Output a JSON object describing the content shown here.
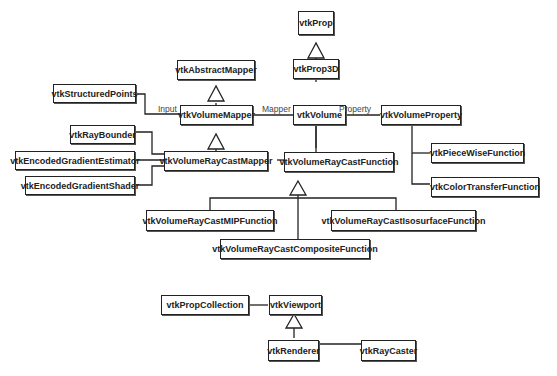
{
  "diagram": {
    "type": "uml-class-diagram",
    "classes": {
      "vtkProp": "vtkProp",
      "vtkProp3D": "vtkProp3D",
      "vtkAbstractMapper": "vtkAbstractMapper",
      "vtkStructuredPoints": "vtkStructuredPoints",
      "vtkVolumeMapper": "vtkVolumeMapper",
      "vtkVolume": "vtkVolume",
      "vtkVolumeProperty": "vtkVolumeProperty",
      "vtkRayBounder": "vtkRayBounder",
      "vtkEncodedGradientEstimator": "vtkEncodedGradientEstimator",
      "vtkEncodedGradientShader": "vtkEncodedGradientShader",
      "vtkVolumeRayCastMapper": "vtkVolumeRayCastMapper",
      "vtkVolumeRayCastFunction": "vtkVolumeRayCastFunction",
      "vtkPieceWiseFunction": "vtkPieceWiseFunction",
      "vtkColorTransferFunction": "vtkColorTransferFunction",
      "vtkVolumeRayCastMIPFunction": "vtkVolumeRayCastMIPFunction",
      "vtkVolumeRayCastIsosurfaceFunction": "vtkVolumeRayCastIsosurfaceFunction",
      "vtkVolumeRayCastCompositeFunction": "vtkVolumeRayCastCompositeFunction",
      "vtkPropCollection": "vtkPropCollection",
      "vtkViewport": "vtkViewport",
      "vtkRenderer": "vtkRenderer",
      "vtkRayCaster": "vtkRayCaster"
    },
    "association_labels": {
      "input": "Input",
      "mapper": "Mapper",
      "property": "Property"
    },
    "relations": [
      {
        "type": "inheritance",
        "child": "vtkProp3D",
        "parent": "vtkProp"
      },
      {
        "type": "inheritance",
        "child": "vtkVolume",
        "parent": "vtkProp3D"
      },
      {
        "type": "inheritance",
        "child": "vtkVolumeMapper",
        "parent": "vtkAbstractMapper"
      },
      {
        "type": "inheritance",
        "child": "vtkVolumeRayCastMapper",
        "parent": "vtkVolumeMapper"
      },
      {
        "type": "inheritance",
        "child": "vtkVolumeRayCastMIPFunction",
        "parent": "vtkVolumeRayCastFunction"
      },
      {
        "type": "inheritance",
        "child": "vtkVolumeRayCastIsosurfaceFunction",
        "parent": "vtkVolumeRayCastFunction"
      },
      {
        "type": "inheritance",
        "child": "vtkVolumeRayCastCompositeFunction",
        "parent": "vtkVolumeRayCastFunction"
      },
      {
        "type": "inheritance",
        "child": "vtkRenderer",
        "parent": "vtkViewport"
      },
      {
        "type": "association",
        "from": "vtkStructuredPoints",
        "to": "vtkVolumeMapper",
        "label": "Input"
      },
      {
        "type": "association",
        "from": "vtkVolumeMapper",
        "to": "vtkVolume",
        "label": "Mapper"
      },
      {
        "type": "association",
        "from": "vtkVolume",
        "to": "vtkVolumeProperty",
        "label": "Property"
      },
      {
        "type": "association",
        "from": "vtkVolume",
        "to": "vtkVolumeRayCastFunction"
      },
      {
        "type": "association",
        "from": "vtkVolumeRayCastMapper",
        "to": "vtkVolumeRayCastFunction"
      },
      {
        "type": "association",
        "from": "vtkRayBounder",
        "to": "vtkVolumeRayCastMapper"
      },
      {
        "type": "association",
        "from": "vtkEncodedGradientEstimator",
        "to": "vtkVolumeRayCastMapper"
      },
      {
        "type": "association",
        "from": "vtkEncodedGradientShader",
        "to": "vtkVolumeRayCastMapper"
      },
      {
        "type": "association",
        "from": "vtkVolumeProperty",
        "to": "vtkPieceWiseFunction"
      },
      {
        "type": "association",
        "from": "vtkVolumeProperty",
        "to": "vtkColorTransferFunction"
      },
      {
        "type": "association",
        "from": "vtkPropCollection",
        "to": "vtkViewport"
      },
      {
        "type": "association",
        "from": "vtkRenderer",
        "to": "vtkRayCaster"
      }
    ]
  }
}
